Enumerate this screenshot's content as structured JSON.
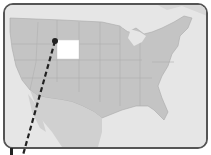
{
  "map": {
    "region": "Contiguous United States",
    "highlighted_state": "Wyoming",
    "colors": {
      "land": "#c4c4c4",
      "water": "#e6e6e6",
      "highlight": "#ffffff",
      "border": "#555555",
      "callout_line": "#222222"
    },
    "callout": {
      "style": "dashed",
      "from": [
        55,
        41
      ],
      "to": [
        23,
        155
      ]
    }
  }
}
